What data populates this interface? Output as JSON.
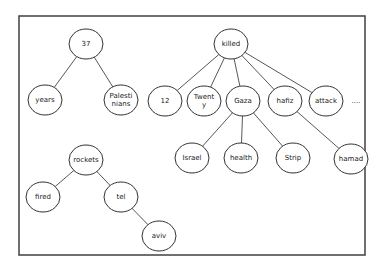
{
  "diagram": {
    "type": "dependency-trees",
    "frame": {
      "x": 19,
      "y": 16,
      "w": 346,
      "h": 239,
      "stroke": "#404040"
    },
    "node_rx": 17,
    "node_ry": 15,
    "trees": [
      {
        "root": "37",
        "nodes": [
          {
            "id": "37",
            "lines": [
              "37"
            ],
            "x": 86,
            "y": 44
          },
          {
            "id": "years",
            "lines": [
              "years"
            ],
            "x": 45,
            "y": 100
          },
          {
            "id": "Palestinians",
            "lines": [
              "Palesti",
              "nians"
            ],
            "x": 121,
            "y": 100
          }
        ],
        "edges": [
          [
            "37",
            "years"
          ],
          [
            "37",
            "Palestinians"
          ]
        ]
      },
      {
        "root": "killed",
        "nodes": [
          {
            "id": "killed",
            "lines": [
              "killed"
            ],
            "x": 231,
            "y": 44
          },
          {
            "id": "12",
            "lines": [
              "12"
            ],
            "x": 165,
            "y": 101
          },
          {
            "id": "Twenty",
            "lines": [
              "Twent",
              "y"
            ],
            "x": 204,
            "y": 101
          },
          {
            "id": "Gaza",
            "lines": [
              "Gaza"
            ],
            "x": 243,
            "y": 101
          },
          {
            "id": "hafiz",
            "lines": [
              "hafiz"
            ],
            "x": 285,
            "y": 101
          },
          {
            "id": "attack",
            "lines": [
              "attack"
            ],
            "x": 326,
            "y": 101
          },
          {
            "id": "Israel",
            "lines": [
              "Israel"
            ],
            "x": 192,
            "y": 158
          },
          {
            "id": "health",
            "lines": [
              "health"
            ],
            "x": 241,
            "y": 158
          },
          {
            "id": "Strip",
            "lines": [
              "Strip"
            ],
            "x": 293,
            "y": 158
          },
          {
            "id": "hamad",
            "lines": [
              "hamad"
            ],
            "x": 351,
            "y": 159
          }
        ],
        "edges": [
          [
            "killed",
            "12"
          ],
          [
            "killed",
            "Twenty"
          ],
          [
            "killed",
            "Gaza"
          ],
          [
            "killed",
            "hafiz"
          ],
          [
            "killed",
            "attack"
          ],
          [
            "Gaza",
            "Israel"
          ],
          [
            "Gaza",
            "health"
          ],
          [
            "Gaza",
            "Strip"
          ],
          [
            "hafiz",
            "hamad"
          ]
        ],
        "ellipsis": {
          "text": "....",
          "x": 356,
          "y": 101
        }
      },
      {
        "root": "rockets",
        "nodes": [
          {
            "id": "rockets",
            "lines": [
              "rockets"
            ],
            "x": 86,
            "y": 160
          },
          {
            "id": "fired",
            "lines": [
              "fired"
            ],
            "x": 43,
            "y": 197
          },
          {
            "id": "tel",
            "lines": [
              "tel"
            ],
            "x": 121,
            "y": 197
          },
          {
            "id": "aviv",
            "lines": [
              "aviv"
            ],
            "x": 159,
            "y": 236
          }
        ],
        "edges": [
          [
            "rockets",
            "fired"
          ],
          [
            "rockets",
            "tel"
          ],
          [
            "tel",
            "aviv"
          ]
        ]
      }
    ]
  }
}
